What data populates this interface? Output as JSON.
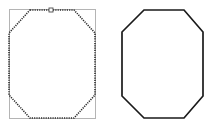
{
  "canvas": {
    "title": "Octagon shape comparison",
    "width": 216,
    "height": 128,
    "background_color": "#ffffff"
  },
  "shapes": [
    {
      "id": "left-octagon",
      "name": "Dotted octagon with selection bounding box",
      "stroke_style": "dotted",
      "stroke_color": "#2b2b2b",
      "stroke_width": 1.6,
      "fill_color": "none",
      "selected": true,
      "bounding_box": {
        "x": 9,
        "y": 9,
        "width": 86,
        "height": 109,
        "stroke_color": "#b4b4b4",
        "stroke_width": 1
      },
      "vertex_handle": {
        "name": "top-edge-handle",
        "x": 51,
        "y": 10,
        "size": 4,
        "fill_color": "#ffffff",
        "stroke_color": "#4a4a4a"
      },
      "points": "30,10 74,10 95,33 95,95 74,118 30,118 9,95 9,33"
    },
    {
      "id": "right-octagon",
      "name": "Solid octagon",
      "stroke_style": "solid",
      "stroke_color": "#1a1a1a",
      "stroke_width": 1.7,
      "fill_color": "none",
      "selected": false,
      "points": "144,10 184,10 203,32 203,96 184,118 144,118 122,96 122,32"
    }
  ],
  "legend": {
    "left_caption": "",
    "right_caption": ""
  }
}
